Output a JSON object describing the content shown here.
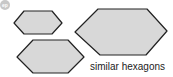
{
  "badge": {
    "label": "ep",
    "color": "#c8c8c8"
  },
  "caption": "similar hexagons",
  "style": {
    "fill": "#d8d8d8",
    "stroke": "#222222"
  },
  "hexagons": [
    {
      "name": "small-hexagon",
      "points": "14,23 24,11 52,11 62,23 52,34 24,34"
    },
    {
      "name": "medium-hexagon",
      "points": "17,57 33,40 68,40 84,57 68,73 33,73"
    },
    {
      "name": "large-hexagon",
      "points": "75,32 98,9 147,9 167,31 146,55 100,55"
    }
  ]
}
